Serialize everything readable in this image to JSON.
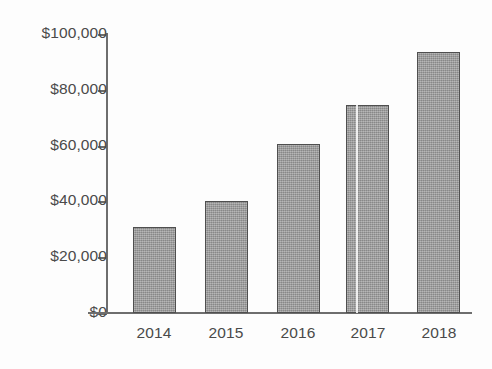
{
  "chart_data": {
    "type": "bar",
    "title": "",
    "subtitle": "",
    "xlabel": "",
    "ylabel": "",
    "categories": [
      "2014",
      "2015",
      "2016",
      "2017",
      "2018"
    ],
    "values": [
      31000,
      40000,
      60500,
      74500,
      93500
    ],
    "ylim": [
      0,
      100000
    ],
    "ytick_values": [
      0,
      20000,
      40000,
      60000,
      80000,
      100000
    ],
    "ytick_labels": [
      "$0",
      "$20,000",
      "$40,000",
      "$60,000",
      "$80,000",
      "$100,000"
    ],
    "grid": false,
    "legend": null,
    "annotations": [],
    "colors": {
      "bar_fill": "#9b9b9b",
      "bar_outline": "#4f4f4f",
      "axis": "#6e6e6e",
      "text": "#4a4a4a",
      "background": "#fdfdfd",
      "scan_artifact": "#f4f4f4"
    }
  }
}
